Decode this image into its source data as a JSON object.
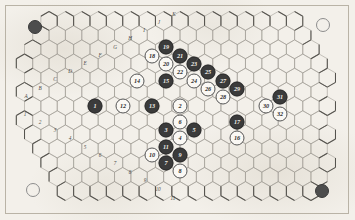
{
  "diagram": {
    "background_color": "#f3f0ea",
    "line_color": "#8c8c8c",
    "board_shape": "rhombus-hexgrid"
  },
  "corner_markers": [
    {
      "name": "corner-marker-top-left",
      "style": "dark",
      "x": 35,
      "y": 27
    },
    {
      "name": "corner-marker-top-right",
      "style": "light",
      "x": 323,
      "y": 25
    },
    {
      "name": "corner-marker-bottom-left",
      "style": "light",
      "x": 33,
      "y": 190
    },
    {
      "name": "corner-marker-bottom-right",
      "style": "dark",
      "x": 322,
      "y": 191
    }
  ],
  "edge_labels": {
    "letters": [
      {
        "label": "A",
        "x": 26,
        "y": 96
      },
      {
        "label": "B",
        "x": 40,
        "y": 88
      },
      {
        "label": "C",
        "x": 55,
        "y": 79
      },
      {
        "label": "D",
        "x": 70,
        "y": 71
      },
      {
        "label": "E",
        "x": 85,
        "y": 63
      },
      {
        "label": "F",
        "x": 100,
        "y": 55
      },
      {
        "label": "G",
        "x": 115,
        "y": 47
      },
      {
        "label": "H",
        "x": 130,
        "y": 38
      },
      {
        "label": "I",
        "x": 144,
        "y": 30
      },
      {
        "label": "J",
        "x": 159,
        "y": 22
      },
      {
        "label": "K",
        "x": 174,
        "y": 14
      }
    ],
    "numbers": [
      {
        "label": "1",
        "x": 25,
        "y": 114
      },
      {
        "label": "2",
        "x": 40,
        "y": 122
      },
      {
        "label": "3",
        "x": 55,
        "y": 130
      },
      {
        "label": "4",
        "x": 70,
        "y": 138
      },
      {
        "label": "5",
        "x": 85,
        "y": 147
      },
      {
        "label": "6",
        "x": 100,
        "y": 155
      },
      {
        "label": "7",
        "x": 115,
        "y": 163
      },
      {
        "label": "8",
        "x": 130,
        "y": 172
      },
      {
        "label": "9",
        "x": 145,
        "y": 180
      },
      {
        "label": "10",
        "x": 158,
        "y": 189
      },
      {
        "label": "11",
        "x": 173,
        "y": 198
      }
    ]
  },
  "pieces": [
    {
      "n": "1",
      "style": "dark",
      "x": 95,
      "y": 106
    },
    {
      "n": "2",
      "style": "light",
      "x": 180,
      "y": 106
    },
    {
      "n": "3",
      "style": "dark",
      "x": 166,
      "y": 130
    },
    {
      "n": "4",
      "style": "light",
      "x": 180,
      "y": 138
    },
    {
      "n": "5",
      "style": "dark",
      "x": 194,
      "y": 130
    },
    {
      "n": "6",
      "style": "light",
      "x": 180,
      "y": 122
    },
    {
      "n": "7",
      "style": "dark",
      "x": 166,
      "y": 163
    },
    {
      "n": "8",
      "style": "light",
      "x": 180,
      "y": 171
    },
    {
      "n": "9",
      "style": "dark",
      "x": 180,
      "y": 155
    },
    {
      "n": "10",
      "style": "light",
      "x": 152,
      "y": 155
    },
    {
      "n": "11",
      "style": "dark",
      "x": 166,
      "y": 147
    },
    {
      "n": "12",
      "style": "light",
      "x": 123,
      "y": 106
    },
    {
      "n": "13",
      "style": "dark",
      "x": 152,
      "y": 106
    },
    {
      "n": "14",
      "style": "light",
      "x": 137,
      "y": 81
    },
    {
      "n": "15",
      "style": "dark",
      "x": 166,
      "y": 81
    },
    {
      "n": "16",
      "style": "light",
      "x": 237,
      "y": 138
    },
    {
      "n": "17",
      "style": "dark",
      "x": 237,
      "y": 122
    },
    {
      "n": "18",
      "style": "light",
      "x": 152,
      "y": 56
    },
    {
      "n": "19",
      "style": "dark",
      "x": 166,
      "y": 47
    },
    {
      "n": "20",
      "style": "light",
      "x": 166,
      "y": 64
    },
    {
      "n": "21",
      "style": "dark",
      "x": 180,
      "y": 56
    },
    {
      "n": "22",
      "style": "light",
      "x": 180,
      "y": 72
    },
    {
      "n": "23",
      "style": "dark",
      "x": 194,
      "y": 64
    },
    {
      "n": "24",
      "style": "light",
      "x": 194,
      "y": 81
    },
    {
      "n": "25",
      "style": "dark",
      "x": 208,
      "y": 72
    },
    {
      "n": "26",
      "style": "light",
      "x": 208,
      "y": 89
    },
    {
      "n": "27",
      "style": "dark",
      "x": 223,
      "y": 81
    },
    {
      "n": "28",
      "style": "light",
      "x": 223,
      "y": 97
    },
    {
      "n": "29",
      "style": "dark",
      "x": 237,
      "y": 89
    },
    {
      "n": "30",
      "style": "light",
      "x": 266,
      "y": 106
    },
    {
      "n": "31",
      "style": "dark",
      "x": 280,
      "y": 97
    },
    {
      "n": "32",
      "style": "light",
      "x": 280,
      "y": 114
    }
  ]
}
